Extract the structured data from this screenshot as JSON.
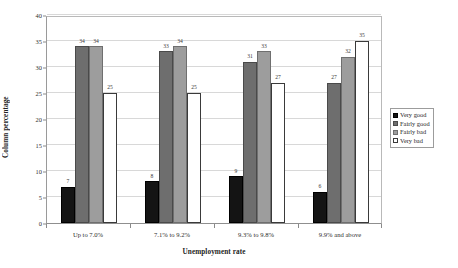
{
  "chart_data": {
    "type": "bar",
    "title": "",
    "xlabel": "Unemployment rate",
    "ylabel": "Column percentage",
    "ylim": [
      0,
      40
    ],
    "yticks": [
      0,
      5,
      10,
      15,
      20,
      25,
      30,
      35,
      40
    ],
    "grid": true,
    "legend_position": "right",
    "categories": [
      "Up to 7.0%",
      "7.1% to 9.2%",
      "9.3% to 9.8%",
      "9.9% and above"
    ],
    "series": [
      {
        "name": "Very good",
        "color": "#141414",
        "values": [
          7,
          8,
          9,
          6
        ],
        "labels": [
          "7",
          "8",
          "9",
          "6"
        ]
      },
      {
        "name": "Fairly good",
        "color": "#6e6e6e",
        "values": [
          34,
          33,
          31,
          27
        ],
        "labels": [
          "34",
          "33",
          "31",
          "27"
        ]
      },
      {
        "name": "Fairly bad",
        "color": "#9d9d9d",
        "values": [
          34,
          34,
          33,
          32
        ],
        "labels": [
          "34",
          "34",
          "33",
          "32"
        ]
      },
      {
        "name": "Very bad",
        "color": "#ffffff",
        "values": [
          25,
          25,
          27,
          35
        ],
        "labels": [
          "25",
          "25",
          "27",
          "35"
        ]
      }
    ]
  },
  "legend": {
    "items": [
      {
        "label": "Very good"
      },
      {
        "label": "Fairly good"
      },
      {
        "label": "Fairly bad"
      },
      {
        "label": "Very bad"
      }
    ]
  }
}
